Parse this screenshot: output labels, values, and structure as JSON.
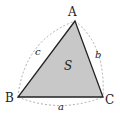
{
  "diagram": {
    "vertices": [
      {
        "label": "A"
      },
      {
        "label": "B"
      },
      {
        "label": "C"
      }
    ],
    "sides": [
      {
        "label": "a"
      },
      {
        "label": "b"
      },
      {
        "label": "c"
      }
    ],
    "area_label": "S",
    "colors": {
      "fill": "#c8c8c8",
      "edge": "#222222",
      "arc": "#9a9a9a"
    }
  }
}
